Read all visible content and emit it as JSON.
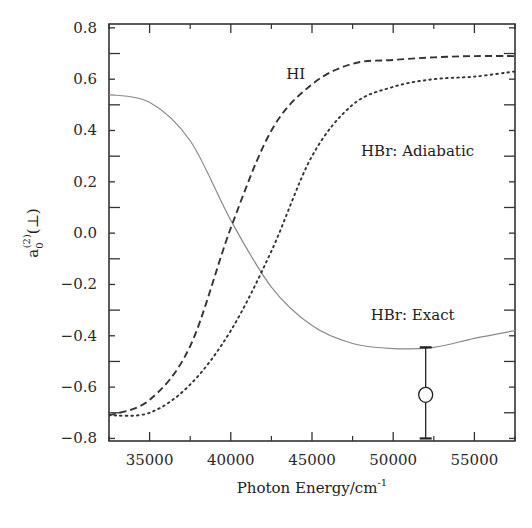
{
  "chart_data": {
    "type": "line",
    "title": "",
    "xlabel": "Photon Energy/cm",
    "xlabel_superscript": "-1",
    "ylabel": "a",
    "ylabel_superscript": "(2)",
    "ylabel_subscript": "0",
    "ylabel_suffix": "(⊥)",
    "xlim": [
      32500,
      57500
    ],
    "ylim": [
      -0.81,
      0.815
    ],
    "grid": false,
    "legend": "none (inline annotations)",
    "x_ticks": [
      35000,
      40000,
      45000,
      50000,
      55000
    ],
    "x_tick_labels": [
      "35000",
      "40000",
      "45000",
      "50000",
      "55000"
    ],
    "x_minor_ticks": [
      32500,
      37500,
      42500,
      47500,
      52500,
      57500
    ],
    "y_ticks": [
      0.8,
      0.6,
      0.4,
      0.2,
      0.0,
      -0.2,
      -0.4,
      -0.6,
      -0.8
    ],
    "y_tick_labels": [
      "0.8",
      "0.6",
      "0.4",
      "0.2",
      "0.0",
      "−0.2",
      "−0.4",
      "−0.6",
      "−0.8"
    ],
    "x": [
      32500,
      35000,
      37500,
      40000,
      42500,
      45000,
      47500,
      50000,
      52500,
      55000,
      57500
    ],
    "series": [
      {
        "name": "HBr: Exact",
        "style": "solid",
        "color": "#8a8a8a",
        "values": [
          0.54,
          0.51,
          0.36,
          0.05,
          -0.21,
          -0.36,
          -0.43,
          -0.45,
          -0.445,
          -0.41,
          -0.38
        ]
      },
      {
        "name": "HI",
        "style": "dashed",
        "color": "#333333",
        "values": [
          -0.71,
          -0.65,
          -0.44,
          0.02,
          0.4,
          0.58,
          0.66,
          0.675,
          0.685,
          0.69,
          0.69
        ]
      },
      {
        "name": "HBr: Adiabatic",
        "style": "dotted",
        "color": "#333333",
        "values": [
          -0.71,
          -0.7,
          -0.59,
          -0.38,
          -0.07,
          0.3,
          0.5,
          0.57,
          0.6,
          0.61,
          0.63
        ]
      }
    ],
    "experimental_point": {
      "x": 52000,
      "y": -0.63,
      "y_upper": -0.445,
      "y_lower": -0.8,
      "marker": "open-circle"
    },
    "annotations": [
      {
        "text": "HI",
        "x": 44000,
        "y": 0.6
      },
      {
        "text": "HBr: Adiabatic",
        "x": 51500,
        "y": 0.3
      },
      {
        "text": "HBr: Exact",
        "x": 51200,
        "y": -0.34
      }
    ]
  }
}
